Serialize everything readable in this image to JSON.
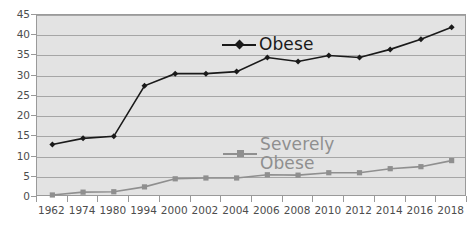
{
  "chart_data": {
    "type": "line",
    "title": "",
    "xlabel": "",
    "ylabel": "",
    "ylim": [
      0,
      45
    ],
    "ytick_step": 5,
    "yticks": [
      "0",
      "5",
      "10",
      "15",
      "20",
      "25",
      "30",
      "35",
      "40",
      "45"
    ],
    "grid": true,
    "legend_position": "inside",
    "plot_background": "#e3e3e3",
    "categories": [
      "1962",
      "1974",
      "1980",
      "1994",
      "2000",
      "2002",
      "2004",
      "2006",
      "2008",
      "2010",
      "2012",
      "2014",
      "2016",
      "2018"
    ],
    "series": [
      {
        "name": "Obese",
        "color": "#1a1a1a",
        "marker": "diamond",
        "values": [
          13,
          14.5,
          15,
          27.5,
          30.5,
          30.5,
          31,
          34.5,
          33.5,
          35,
          34.5,
          36.5,
          39,
          42
        ]
      },
      {
        "name": "Severely\nObese",
        "color": "#8f8f8f",
        "marker": "square",
        "values": [
          0.5,
          1.2,
          1.3,
          2.5,
          4.5,
          4.7,
          4.7,
          5.5,
          5.4,
          6,
          6,
          7,
          7.5,
          9
        ]
      }
    ]
  },
  "legend": {
    "obese": "Obese",
    "severely_obese": "Severely\nObese"
  },
  "colors": {
    "obese": "#1a1a1a",
    "severely_obese": "#8f8f8f",
    "plot_bg": "#e3e3e3",
    "gridline": "#a6a6a6",
    "axis_text": "#4d4d4d"
  }
}
